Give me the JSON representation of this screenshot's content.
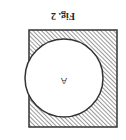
{
  "figure": {
    "caption": "Fig. 2",
    "orientation": "rotated 180°",
    "region_label": "A",
    "shapes": {
      "square": {
        "fill": "diagonal hatching",
        "stroke": "#333333"
      },
      "circle": {
        "fill": "#ffffff",
        "stroke": "#333333"
      }
    }
  }
}
